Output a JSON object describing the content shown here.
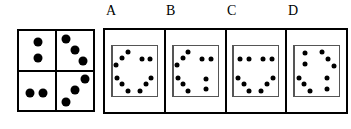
{
  "figure": {
    "type": "domino-matrix-puzzle",
    "ink_color": "#000000",
    "background_color": "#ffffff",
    "labels": [
      "A",
      "B",
      "C",
      "D"
    ]
  },
  "reference": {
    "name": "reference-domino",
    "quadrants": {
      "tl": {
        "count": 2,
        "arrangement": "vertical",
        "dots": [
          [
            50,
            28
          ],
          [
            50,
            68
          ]
        ]
      },
      "tr": {
        "count": 3,
        "arrangement": "diagonal-down-right",
        "dots": [
          [
            26,
            20
          ],
          [
            50,
            47
          ],
          [
            74,
            75
          ]
        ]
      },
      "bl": {
        "count": 2,
        "arrangement": "horizontal",
        "dots": [
          [
            30,
            56
          ],
          [
            66,
            56
          ]
        ]
      },
      "br": {
        "count": 3,
        "arrangement": "diagonal-down-left",
        "dots": [
          [
            78,
            22
          ],
          [
            52,
            50
          ],
          [
            26,
            80
          ]
        ]
      }
    }
  },
  "options": [
    {
      "label": "A",
      "name": "option-a",
      "quadrants": {
        "tl": {
          "count": 3,
          "arrangement": "diagonal-down-left",
          "dots": [
            [
              70,
              22
            ],
            [
              44,
              48
            ],
            [
              18,
              74
            ]
          ]
        },
        "tr": {
          "count": 2,
          "arrangement": "horizontal",
          "dots": [
            [
              32,
              50
            ],
            [
              70,
              50
            ]
          ]
        },
        "bl": {
          "count": 3,
          "arrangement": "diagonal-down-right",
          "dots": [
            [
              22,
              26
            ],
            [
              46,
              52
            ],
            [
              70,
              78
            ]
          ]
        },
        "br": {
          "count": 3,
          "arrangement": "diagonal-down-left",
          "dots": [
            [
              76,
              26
            ],
            [
              50,
              52
            ],
            [
              24,
              78
            ]
          ]
        }
      }
    },
    {
      "label": "B",
      "name": "option-b",
      "quadrants": {
        "tl": {
          "count": 3,
          "arrangement": "diagonal-down-left",
          "dots": [
            [
              70,
              22
            ],
            [
              44,
              48
            ],
            [
              18,
              74
            ]
          ]
        },
        "tr": {
          "count": 2,
          "arrangement": "horizontal",
          "dots": [
            [
              32,
              50
            ],
            [
              70,
              50
            ]
          ]
        },
        "bl": {
          "count": 3,
          "arrangement": "diagonal-down-right",
          "dots": [
            [
              22,
              26
            ],
            [
              46,
              52
            ],
            [
              70,
              78
            ]
          ]
        },
        "br": {
          "count": 2,
          "arrangement": "vertical",
          "dots": [
            [
              50,
              30
            ],
            [
              50,
              72
            ]
          ]
        }
      }
    },
    {
      "label": "C",
      "name": "option-c",
      "quadrants": {
        "tl": {
          "count": 2,
          "arrangement": "horizontal",
          "dots": [
            [
              30,
              50
            ],
            [
              68,
              50
            ]
          ]
        },
        "tr": {
          "count": 2,
          "arrangement": "horizontal",
          "dots": [
            [
              32,
              50
            ],
            [
              70,
              50
            ]
          ]
        },
        "bl": {
          "count": 3,
          "arrangement": "diagonal-down-right",
          "dots": [
            [
              22,
              26
            ],
            [
              46,
              52
            ],
            [
              70,
              78
            ]
          ]
        },
        "br": {
          "count": 3,
          "arrangement": "diagonal-down-left",
          "dots": [
            [
              76,
              26
            ],
            [
              50,
              52
            ],
            [
              24,
              78
            ]
          ]
        }
      }
    },
    {
      "label": "D",
      "name": "option-d",
      "quadrants": {
        "tl": {
          "count": 2,
          "arrangement": "vertical",
          "dots": [
            [
              48,
              28
            ],
            [
              48,
              70
            ]
          ]
        },
        "tr": {
          "count": 3,
          "arrangement": "diagonal-down-right",
          "dots": [
            [
              24,
              22
            ],
            [
              50,
              50
            ],
            [
              76,
              78
            ]
          ]
        },
        "bl": {
          "count": 3,
          "arrangement": "diagonal-down-right",
          "dots": [
            [
              22,
              26
            ],
            [
              46,
              52
            ],
            [
              70,
              78
            ]
          ]
        },
        "br": {
          "count": 2,
          "arrangement": "vertical",
          "dots": [
            [
              48,
              28
            ],
            [
              48,
              70
            ]
          ]
        }
      }
    }
  ]
}
